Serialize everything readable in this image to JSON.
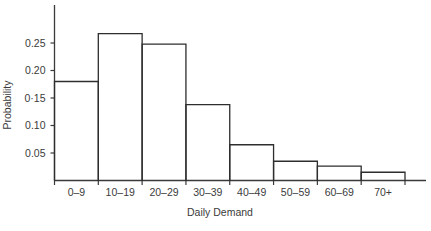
{
  "chart_data": {
    "type": "bar",
    "title": "",
    "subtitle": "",
    "xlabel": "Daily Demand",
    "ylabel": "Probability",
    "categories": [
      "0–9",
      "10–19",
      "20–29",
      "30–39",
      "40–49",
      "50–59",
      "60–69",
      "70+"
    ],
    "values": [
      0.18,
      0.267,
      0.248,
      0.138,
      0.065,
      0.035,
      0.026,
      0.015
    ],
    "ylim": [
      0,
      0.28
    ],
    "xlim": [
      0,
      8
    ],
    "ytick_values": [
      0.05,
      0.1,
      0.15,
      0.2,
      0.25
    ],
    "ytick_labels": [
      "0.05",
      "0.10",
      "0·15",
      "0.20",
      "0.25"
    ],
    "grid": false,
    "legend": null,
    "legend_position": "none",
    "bar_style": "outline",
    "colors": {
      "axis": "#3a3a3a",
      "bar_outline": "#2e2e2e",
      "bar_fill": "none",
      "text": "#3b3b3b",
      "background": "#ffffff"
    }
  },
  "axes": {
    "x_axis_name": "x-axis",
    "y_axis_name": "y-axis"
  }
}
